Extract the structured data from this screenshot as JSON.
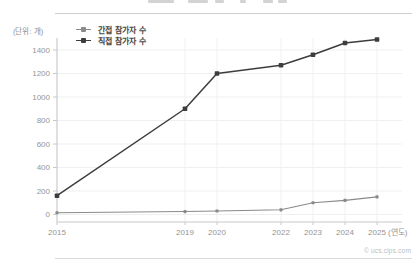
{
  "unit_label": "(단위: 개)",
  "x_unit_label": "(연도)",
  "watermark": "© ucs.cips.com",
  "legend": [
    {
      "label": "간접 참가자 수",
      "color": "#8a8a8a"
    },
    {
      "label": "직접 참가자 수",
      "color": "#3d3d3d"
    }
  ],
  "chart_data": {
    "type": "line",
    "x": [
      2015,
      2019,
      2020,
      2022,
      2023,
      2024,
      2025
    ],
    "x_tick_labels": [
      "2015",
      "2019",
      "2020",
      "2022",
      "2023",
      "2024",
      "2025"
    ],
    "series": [
      {
        "name": "간접 참가자 수",
        "values": [
          15,
          25,
          30,
          40,
          100,
          120,
          150
        ],
        "color": "#8a8a8a",
        "line_width": 1.1,
        "marker_size": 3.2
      },
      {
        "name": "직접 참가자 수",
        "values": [
          160,
          900,
          1200,
          1270,
          1360,
          1460,
          1490
        ],
        "color": "#3d3d3d",
        "line_width": 1.5,
        "marker_size": 4.6
      }
    ],
    "ylabel": "(단위: 개)",
    "xlabel": "(연도)",
    "ylim": [
      0,
      1400
    ],
    "yticks": [
      0,
      200,
      400,
      600,
      800,
      1000,
      1200,
      1400
    ],
    "grid": true,
    "legend_position": "top-left"
  }
}
